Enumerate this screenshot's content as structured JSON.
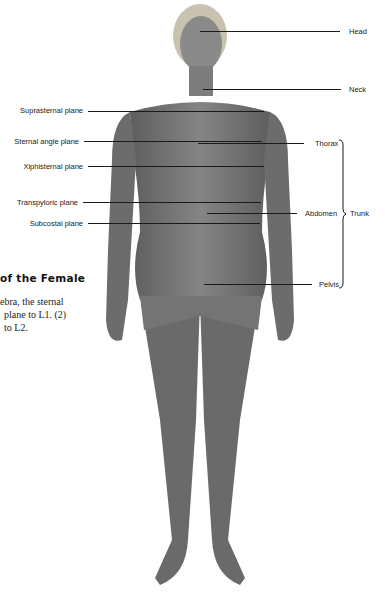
{
  "figure": {
    "left_labels": [
      {
        "id": "suprasternal",
        "text": "Suprasternal plane",
        "y": 110
      },
      {
        "id": "sternal-angle",
        "text": "Sternal angle plane",
        "y": 141
      },
      {
        "id": "xiphisternal",
        "text": "Xiphisternal plane",
        "y": 166
      },
      {
        "id": "transpyloric",
        "text": "Transpyloric plane",
        "y": 202
      },
      {
        "id": "subcostal",
        "text": "Subcostal plane",
        "y": 223
      }
    ],
    "right_labels": [
      {
        "id": "head",
        "text": "Head",
        "y": 31
      },
      {
        "id": "neck",
        "text": "Neck",
        "y": 89
      },
      {
        "id": "thorax",
        "text": "Thorax",
        "y": 143
      },
      {
        "id": "abdomen",
        "text": "Abdomen",
        "y": 213
      },
      {
        "id": "pelvis",
        "text": "Pelvis",
        "y": 284
      }
    ],
    "bracket_label": "Trunk",
    "colors": {
      "skin": "#7a7a7a",
      "skin_dark": "#5e5e5e",
      "hair": "#c9c2b0",
      "line": "#1a1a1a"
    }
  },
  "caption": {
    "title_fragment": "of the Female",
    "lines": [
      "ebra, the sternal",
      "plane to L1. (2)",
      "to L2."
    ]
  }
}
